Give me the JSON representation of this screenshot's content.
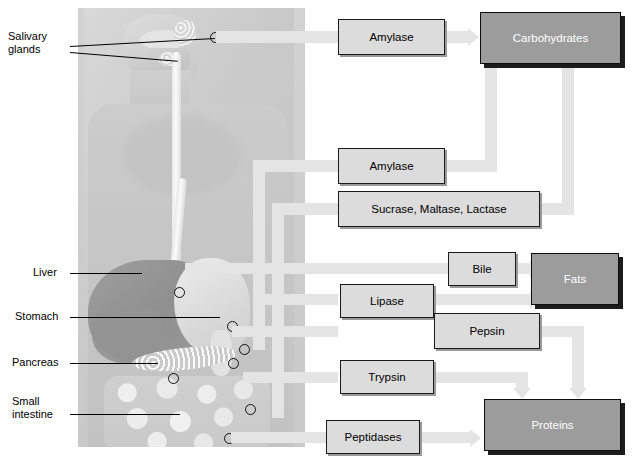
{
  "diagram": {
    "anatomy_panel": {
      "name": "human-digestive-system-illustration",
      "organ_labels": [
        {
          "id": "salivary-glands",
          "text": "Salivary\nglands"
        },
        {
          "id": "liver",
          "text": "Liver"
        },
        {
          "id": "stomach",
          "text": "Stomach"
        },
        {
          "id": "pancreas",
          "text": "Pancreas"
        },
        {
          "id": "small-intestine",
          "text": "Small\nintestine"
        }
      ]
    },
    "enzyme_boxes": [
      {
        "id": "amylase-saliva",
        "label": "Amylase"
      },
      {
        "id": "amylase-pancreas",
        "label": "Amylase"
      },
      {
        "id": "sucrase-maltase-lactase",
        "label": "Sucrase, Maltase, Lactase"
      },
      {
        "id": "bile",
        "label": "Bile"
      },
      {
        "id": "lipase",
        "label": "Lipase"
      },
      {
        "id": "pepsin",
        "label": "Pepsin"
      },
      {
        "id": "trypsin",
        "label": "Trypsin"
      },
      {
        "id": "peptidases",
        "label": "Peptidases"
      }
    ],
    "nutrient_boxes": [
      {
        "id": "carbohydrates",
        "label": "Carbohydrates"
      },
      {
        "id": "fats",
        "label": "Fats"
      },
      {
        "id": "proteins",
        "label": "Proteins"
      }
    ],
    "flows": [
      {
        "from": "salivary-glands",
        "to": "amylase-saliva"
      },
      {
        "from": "amylase-saliva",
        "to": "carbohydrates"
      },
      {
        "from": "pancreas",
        "to": "amylase-pancreas"
      },
      {
        "from": "amylase-pancreas",
        "to": "carbohydrates"
      },
      {
        "from": "small-intestine",
        "to": "sucrase-maltase-lactase"
      },
      {
        "from": "sucrase-maltase-lactase",
        "to": "carbohydrates"
      },
      {
        "from": "liver",
        "to": "bile"
      },
      {
        "from": "bile",
        "to": "fats"
      },
      {
        "from": "pancreas",
        "to": "lipase"
      },
      {
        "from": "lipase",
        "to": "fats"
      },
      {
        "from": "stomach",
        "to": "pepsin"
      },
      {
        "from": "pepsin",
        "to": "proteins"
      },
      {
        "from": "pancreas",
        "to": "trypsin"
      },
      {
        "from": "trypsin",
        "to": "proteins"
      },
      {
        "from": "small-intestine",
        "to": "peptidases"
      },
      {
        "from": "peptidases",
        "to": "proteins"
      }
    ],
    "colors": {
      "enzyme_box_fill": "#dcdcdc",
      "nutrient_box_fill": "#9c9c9c",
      "nutrient_box_text": "#ffffff",
      "connector": "#e4e4e4",
      "panel_background": "#cccccc",
      "border": "#1a1a1a"
    },
    "caption": ""
  }
}
